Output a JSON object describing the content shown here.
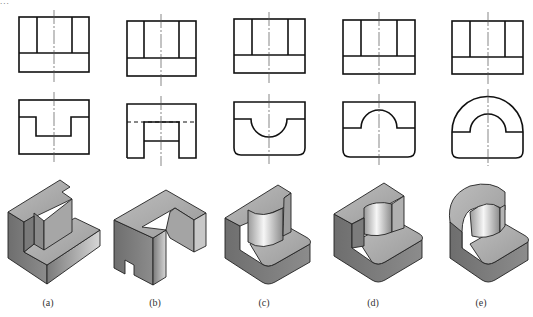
{
  "header_fragment": "...",
  "figures": [
    {
      "id": "a",
      "label": "(a)",
      "label_x": 48
    },
    {
      "id": "b",
      "label": "(b)",
      "label_x": 155
    },
    {
      "id": "c",
      "label": "(c)",
      "label_x": 264
    },
    {
      "id": "d",
      "label": "(d)",
      "label_x": 373
    },
    {
      "id": "e",
      "label": "(e)",
      "label_x": 481
    }
  ],
  "colors": {
    "line": "#111111",
    "center_line": "#555555",
    "solid_light": "#b8b8b8",
    "solid_mid": "#8e8e8e",
    "solid_dark": "#6a6a6a",
    "cylinder_highlight": "#f4f4f4"
  }
}
